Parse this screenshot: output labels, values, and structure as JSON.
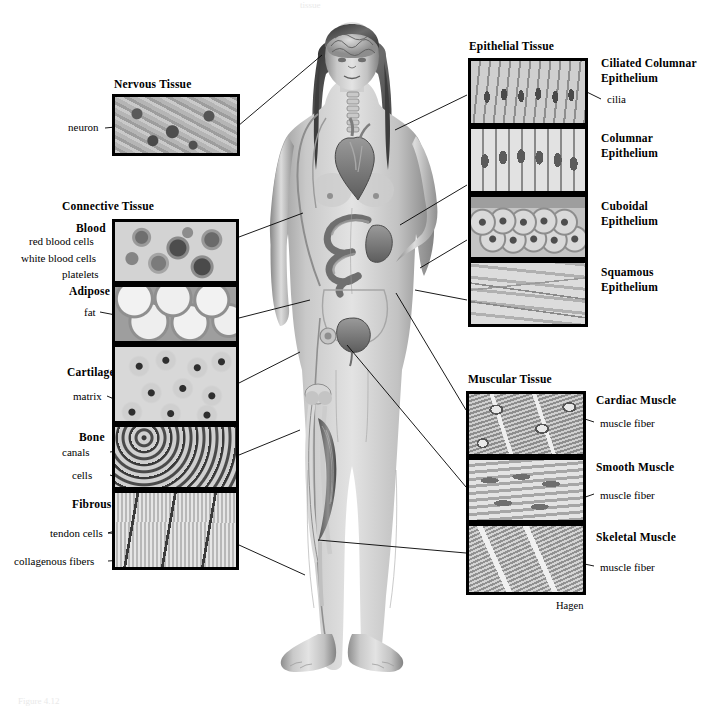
{
  "page": {
    "background_color": "#ffffff",
    "top_faint_text": "tissue",
    "bottom_faint_text": "Figure 4.12",
    "signature": "Hagen",
    "ink_color": "#000000"
  },
  "groups": {
    "nervous": {
      "title": "Nervous Tissue",
      "callouts": [
        {
          "label": "neuron"
        }
      ]
    },
    "connective": {
      "title": "Connective Tissue",
      "subgroups": [
        {
          "name": "Blood",
          "texture": "blood",
          "callouts": [
            {
              "label": "red blood cells"
            },
            {
              "label": "white blood cells"
            },
            {
              "label": "platelets"
            }
          ]
        },
        {
          "name": "Adipose",
          "texture": "adipose",
          "callouts": [
            {
              "label": "fat"
            }
          ]
        },
        {
          "name": "Cartilage",
          "texture": "cartilage",
          "callouts": [
            {
              "label": "matrix"
            }
          ]
        },
        {
          "name": "Bone",
          "texture": "bone",
          "callouts": [
            {
              "label": "canals"
            },
            {
              "label": "cells"
            }
          ]
        },
        {
          "name": "Fibrous",
          "texture": "fibrous",
          "callouts": [
            {
              "label": "tendon cells"
            },
            {
              "label": "collagenous fibers"
            }
          ]
        }
      ]
    },
    "epithelial": {
      "title": "Epithelial Tissue",
      "subgroups": [
        {
          "name": "Ciliated Columnar Epithelium",
          "name_line1": "Ciliated Columnar",
          "name_line2": "Epithelium",
          "texture": "ciliated",
          "callouts": [
            {
              "label": "cilia"
            }
          ]
        },
        {
          "name": "Columnar Epithelium",
          "name_line1": "Columnar",
          "name_line2": "Epithelium",
          "texture": "columnar",
          "callouts": []
        },
        {
          "name": "Cuboidal Epithelium",
          "name_line1": "Cuboidal",
          "name_line2": "Epithelium",
          "texture": "cuboidal",
          "callouts": []
        },
        {
          "name": "Squamous Epithelium",
          "name_line1": "Squamous",
          "name_line2": "Epithelium",
          "texture": "squamous",
          "callouts": []
        }
      ]
    },
    "muscular": {
      "title": "Muscular Tissue",
      "subgroups": [
        {
          "name": "Cardiac Muscle",
          "texture": "cardiac",
          "callouts": [
            {
              "label": "muscle fiber"
            }
          ]
        },
        {
          "name": "Smooth Muscle",
          "texture": "smooth",
          "callouts": [
            {
              "label": "muscle fiber"
            }
          ]
        },
        {
          "name": "Skeletal Muscle",
          "texture": "skeletal",
          "callouts": [
            {
              "label": "muscle fiber"
            }
          ]
        }
      ]
    }
  }
}
